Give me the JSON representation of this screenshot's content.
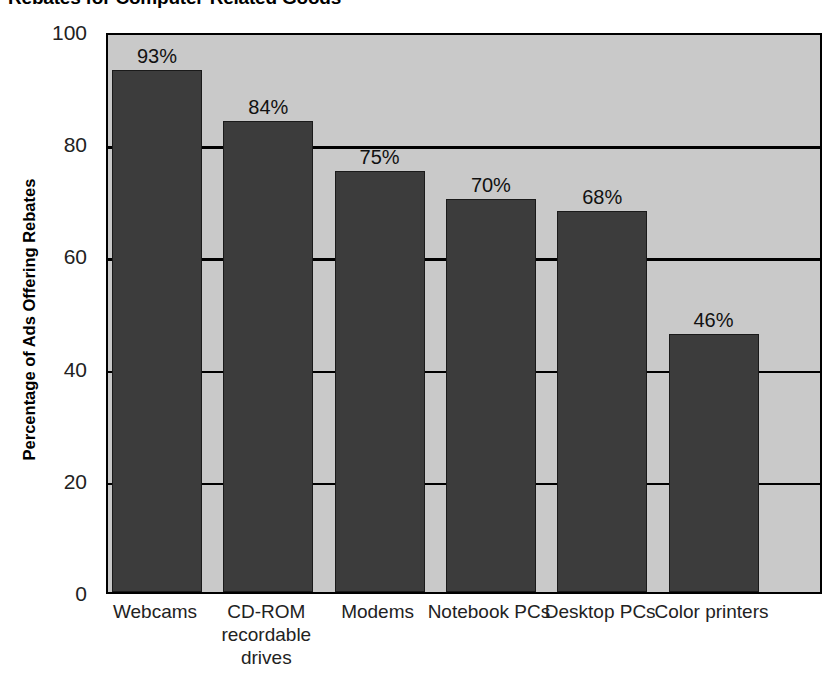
{
  "chart_data": {
    "type": "bar",
    "title": "Rebates for Computer-Related Goods",
    "xlabel": "",
    "ylabel": "Percentage of Ads Offering Rebates",
    "categories": [
      "Webcams",
      "CD-ROM recordable drives",
      "Modems",
      "Notebook PCs",
      "Desktop PCs",
      "Color printers"
    ],
    "category_lines": [
      [
        "Webcams"
      ],
      [
        "CD-ROM",
        "recordable",
        "drives"
      ],
      [
        "Modems"
      ],
      [
        "Notebook PCs"
      ],
      [
        "Desktop PCs"
      ],
      [
        "Color printers"
      ]
    ],
    "values": [
      93,
      84,
      75,
      70,
      68,
      46
    ],
    "value_labels": [
      "93%",
      "84%",
      "75%",
      "70%",
      "68%",
      "46%"
    ],
    "ylim": [
      0,
      100
    ],
    "yticks": [
      0,
      20,
      40,
      60,
      80,
      100
    ],
    "ytick_labels": [
      "0",
      "20",
      "40",
      "60",
      "80",
      "100"
    ],
    "grid": true,
    "legend": false,
    "colors": {
      "bar_fill": "#3c3c3c",
      "bar_edge": "#1a1a1a",
      "plot_background": "#c9c9c9",
      "axis": "#000000",
      "text": "#1a1a1a"
    }
  }
}
